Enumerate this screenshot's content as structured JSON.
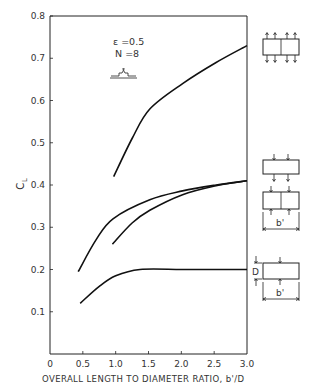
{
  "chart_data": {
    "type": "line",
    "title": "",
    "xlabel": "OVERALL LENGTH TO DIAMETER RATIO, b'/D",
    "ylabel": "C_L",
    "xlim": [
      0,
      3.0
    ],
    "ylim": [
      0,
      0.8
    ],
    "x_ticks": [
      0,
      0.5,
      1.0,
      1.5,
      2.0,
      2.5,
      3.0
    ],
    "x_tick_labels": [
      "0",
      "0.5",
      "1.0",
      "1.5",
      "2.0",
      "2.5",
      "3.0"
    ],
    "y_ticks": [
      0.1,
      0.2,
      0.3,
      0.4,
      0.5,
      0.6,
      0.7,
      0.8
    ],
    "y_tick_labels": [
      "0.1",
      "0.2",
      "0.3",
      "0.4",
      "0.5",
      "0.6",
      "0.7",
      "0.8"
    ],
    "grid": false,
    "annotations": [
      "ε=0.5",
      "N=8"
    ],
    "series": [
      {
        "name": "Two-cell, load in & out both faces",
        "x": [
          0.97,
          1.25,
          1.52,
          2.02,
          2.53,
          3.0
        ],
        "y": [
          0.42,
          0.51,
          0.58,
          0.64,
          0.69,
          0.73
        ]
      },
      {
        "name": "Single-cell, two-sided load",
        "x": [
          0.43,
          0.7,
          0.96,
          1.52,
          2.02,
          2.53,
          3.0
        ],
        "y": [
          0.195,
          0.27,
          0.32,
          0.365,
          0.386,
          0.4,
          0.41
        ]
      },
      {
        "name": "Two-cell, load on top & bottom",
        "x": [
          0.95,
          1.25,
          1.52,
          2.02,
          2.53,
          3.0
        ],
        "y": [
          0.26,
          0.31,
          0.34,
          0.377,
          0.398,
          0.41
        ]
      },
      {
        "name": "Single-cell, D x b'",
        "x": [
          0.46,
          0.75,
          1.0,
          1.37,
          2.0,
          2.5,
          3.0
        ],
        "y": [
          0.12,
          0.16,
          0.185,
          0.2,
          0.2,
          0.2,
          0.2
        ]
      }
    ]
  },
  "labels": {
    "ylabel_main": "C",
    "ylabel_sub": "L",
    "xlabel": "OVERALL LENGTH TO DIAMETER RATIO, b'/D",
    "epsilon": "ε =0.5",
    "n": "N =8",
    "dim_b": "b'",
    "dim_d": "D"
  }
}
